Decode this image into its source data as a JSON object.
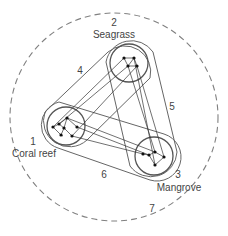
{
  "diagram": {
    "outer_boundary": {
      "label": "7",
      "cx": 114,
      "cy": 114,
      "r": 104
    },
    "habitats": [
      {
        "id": "1",
        "name": "Coral reef",
        "number": "1",
        "cx": 66,
        "cy": 126,
        "r": 18
      },
      {
        "id": "2",
        "name": "Seagrass",
        "number": "2",
        "cx": 129,
        "cy": 63,
        "r": 18
      },
      {
        "id": "3",
        "name": "Mangrove",
        "number": "3",
        "cx": 154,
        "cy": 156,
        "r": 18
      }
    ],
    "connection_zones": [
      {
        "id": "4",
        "label": "4",
        "between": [
          "1",
          "2"
        ]
      },
      {
        "id": "5",
        "label": "5",
        "between": [
          "2",
          "3"
        ]
      },
      {
        "id": "6",
        "label": "6",
        "between": [
          "1",
          "3"
        ]
      }
    ],
    "colors": {
      "stroke": "#555555",
      "node": "#222222",
      "text": "#444444",
      "dashed": "#777777"
    }
  }
}
